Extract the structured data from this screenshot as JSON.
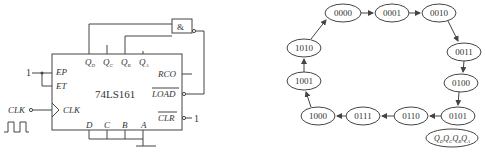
{
  "circuit": {
    "chip_label": "74LS161",
    "gate_label": "&",
    "top_pins": [
      "Q_D",
      "Q_C",
      "Q_B",
      "Q_A"
    ],
    "left_pins": [
      "EP",
      "ET",
      "CLK"
    ],
    "right_pins": [
      "RCO",
      "LOAD",
      "CLR"
    ],
    "bottom_pins": [
      "D",
      "C",
      "B",
      "A"
    ],
    "input_one_left": "1",
    "input_one_right": "1",
    "clk_input_label": "CLK"
  },
  "state_diagram": {
    "states": [
      "0000",
      "0001",
      "0010",
      "0011",
      "0100",
      "0101",
      "0110",
      "0111",
      "1000",
      "1001",
      "1010"
    ],
    "legend": "QDQCQBQA"
  }
}
